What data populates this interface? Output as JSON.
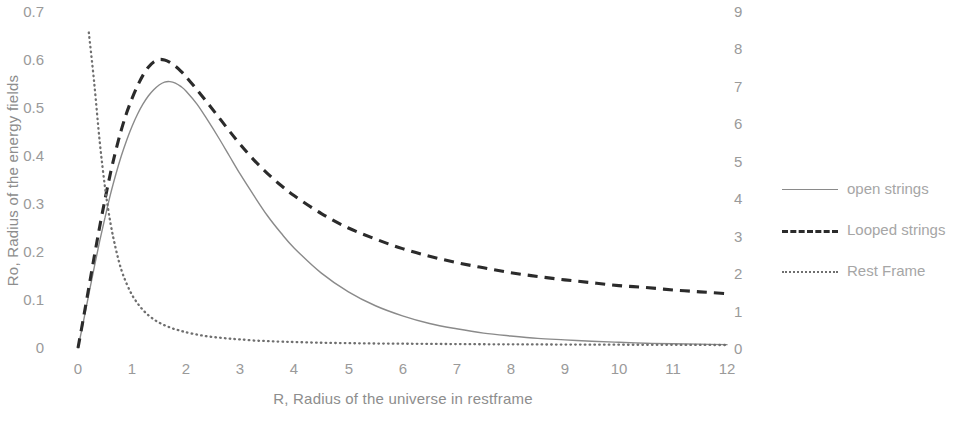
{
  "chart_data": {
    "type": "line",
    "title": "",
    "xlabel": "R, Radius of the universe in restframe",
    "ylabel": "Ro, Radius of the energy fields",
    "y2label": "",
    "xlim": [
      0,
      12
    ],
    "ylim": [
      0,
      0.7
    ],
    "y2lim": [
      0,
      9
    ],
    "grid": false,
    "legend_position": "right",
    "x_ticks": [
      "0",
      "1",
      "2",
      "3",
      "4",
      "5",
      "6",
      "7",
      "8",
      "9",
      "10",
      "11",
      "12"
    ],
    "y_ticks": [
      "0",
      "0.1",
      "0.2",
      "0.3",
      "0.4",
      "0.5",
      "0.6",
      "0.7"
    ],
    "y2_ticks": [
      "0",
      "1",
      "2",
      "3",
      "4",
      "5",
      "6",
      "7",
      "8",
      "9"
    ],
    "x": [
      0,
      0.1,
      0.2,
      0.3,
      0.4,
      0.5,
      0.6,
      0.7,
      0.8,
      0.9,
      1.0,
      1.1,
      1.2,
      1.3,
      1.4,
      1.5,
      1.6,
      1.7,
      1.8,
      1.9,
      2.0,
      2.2,
      2.4,
      2.6,
      2.8,
      3.0,
      3.25,
      3.5,
      3.75,
      4.0,
      4.5,
      5.0,
      5.5,
      6.0,
      6.5,
      7.0,
      7.5,
      8.0,
      8.5,
      9.0,
      9.5,
      10.0,
      10.5,
      11.0,
      11.5,
      12.0
    ],
    "series": [
      {
        "name": "open strings",
        "axis": "left",
        "style": "solid",
        "color": "#8a8a8a",
        "values": [
          0,
          0.055,
          0.112,
          0.168,
          0.222,
          0.272,
          0.32,
          0.362,
          0.4,
          0.433,
          0.462,
          0.487,
          0.508,
          0.525,
          0.538,
          0.548,
          0.554,
          0.555,
          0.552,
          0.545,
          0.535,
          0.508,
          0.474,
          0.438,
          0.4,
          0.362,
          0.318,
          0.276,
          0.24,
          0.208,
          0.156,
          0.117,
          0.088,
          0.067,
          0.051,
          0.04,
          0.031,
          0.025,
          0.02,
          0.017,
          0.014,
          0.012,
          0.01,
          0.009,
          0.008,
          0.007
        ]
      },
      {
        "name": "Looped strings",
        "axis": "left",
        "style": "dashed",
        "color": "#2b2b2b",
        "values": [
          0,
          0.062,
          0.126,
          0.19,
          0.252,
          0.31,
          0.364,
          0.412,
          0.454,
          0.49,
          0.52,
          0.546,
          0.568,
          0.585,
          0.596,
          0.601,
          0.6,
          0.595,
          0.587,
          0.577,
          0.565,
          0.538,
          0.51,
          0.481,
          0.452,
          0.424,
          0.392,
          0.364,
          0.339,
          0.317,
          0.28,
          0.25,
          0.227,
          0.207,
          0.191,
          0.178,
          0.167,
          0.157,
          0.149,
          0.142,
          0.136,
          0.13,
          0.126,
          0.121,
          0.117,
          0.113
        ]
      },
      {
        "name": "Rest Frame",
        "axis": "right",
        "style": "dotted",
        "color": "#6f6f6f",
        "values": [
          null,
          null,
          8.45,
          7.1,
          5.55,
          4.3,
          3.35,
          2.65,
          2.1,
          1.72,
          1.42,
          1.2,
          1.02,
          0.88,
          0.77,
          0.68,
          0.61,
          0.55,
          0.5,
          0.46,
          0.42,
          0.36,
          0.31,
          0.28,
          0.25,
          0.23,
          0.2,
          0.185,
          0.17,
          0.16,
          0.14,
          0.13,
          0.12,
          0.115,
          0.11,
          0.105,
          0.1,
          0.098,
          0.095,
          0.092,
          0.09,
          0.088,
          0.086,
          0.084,
          0.082,
          0.08
        ]
      }
    ]
  },
  "legend": {
    "items": [
      {
        "label": "open strings",
        "style": "solid"
      },
      {
        "label": "Looped strings",
        "style": "dashed"
      },
      {
        "label": "Rest Frame",
        "style": "dotted"
      }
    ]
  }
}
